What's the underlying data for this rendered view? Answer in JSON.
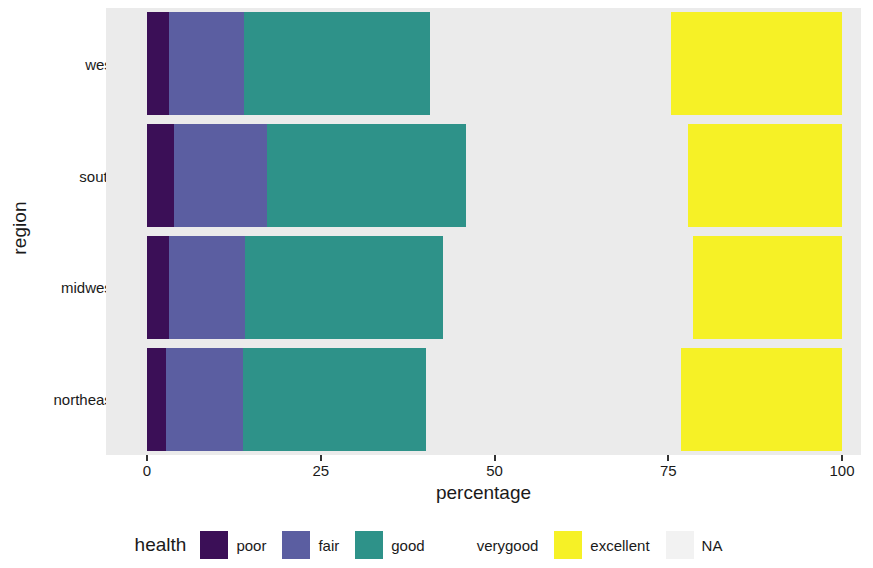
{
  "chart_data": {
    "type": "bar",
    "orientation": "horizontal",
    "stacked": true,
    "stack_mode": "percent",
    "title": "",
    "xlabel": "percentage",
    "ylabel": "region",
    "xlim": [
      0,
      100
    ],
    "xticks": [
      0,
      25,
      50,
      75,
      100
    ],
    "xtick_labels": [
      "0",
      "25",
      "50",
      "75",
      "100"
    ],
    "categories": [
      "west",
      "south",
      "midwest",
      "northeast"
    ],
    "grid": false,
    "panel_background": "#ebebeb",
    "legend": {
      "title": "health",
      "position": "bottom",
      "entries": [
        {
          "label": "poor",
          "color": "#3B0F57"
        },
        {
          "label": "fair",
          "color": "#5B5EA1"
        },
        {
          "label": "good",
          "color": "#2E9289"
        },
        {
          "label": "verygood",
          "color": "#76D койcode"
        },
        {
          "label": "excellent",
          "color": "#F6F126"
        },
        {
          "label": "NA",
          "color": "#F2F2F2"
        }
      ]
    },
    "series": [
      {
        "name": "poor",
        "color": "#3B0F57",
        "values": [
          3.2,
          3.9,
          3.2,
          2.7
        ]
      },
      {
        "name": "fair",
        "color": "#5B5EA1",
        "values": [
          10.8,
          13.4,
          10.9,
          11.1
        ]
      },
      {
        "name": "good",
        "color": "#2E9289",
        "values": [
          26.7,
          28.6,
          28.5,
          26.3
        ]
      },
      {
        "name": "verygood",
        "color": "#76D css",
        "values": [
          34.7,
          31.9,
          36.0,
          36.7
        ]
      },
      {
        "name": "excellent",
        "color": "#F6F126",
        "values": [
          24.6,
          22.2,
          21.4,
          23.2
        ]
      },
      {
        "name": "NA",
        "color": "#F2F2F2",
        "values": [
          0,
          0,
          0,
          0
        ]
      }
    ]
  }
}
